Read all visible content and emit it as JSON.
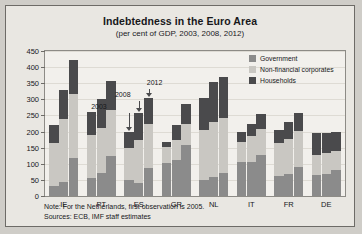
{
  "chart_data": {
    "type": "bar",
    "title": "Indebtedness in the Euro Area",
    "subtitle": "(per cent of GDP, 2003, 2008, 2012)",
    "xlabel": "",
    "ylabel": "",
    "ylim": [
      0,
      450
    ],
    "ytick_step": 50,
    "yticks": [
      "450",
      "400",
      "350",
      "300",
      "250",
      "200",
      "150",
      "100",
      "50",
      "0"
    ],
    "grid": true,
    "legend_position": "top-right",
    "stacked": true,
    "categories": [
      "IE",
      "PT",
      "ES",
      "GR",
      "NL",
      "IT",
      "FR",
      "DE"
    ],
    "years": [
      "2003",
      "2008",
      "2012"
    ],
    "series": [
      {
        "name": "Government",
        "color": "#8b8b8b",
        "values_by_year": {
          "2003": [
            31,
            57,
            49,
            101,
            50,
            105,
            63,
            64
          ],
          "2008": [
            44,
            72,
            40,
            113,
            59,
            106,
            68,
            67
          ],
          "2012": [
            118,
            124,
            88,
            157,
            71,
            127,
            90,
            82
          ]
        }
      },
      {
        "name": "Non-financial corporates",
        "color": "#c9c7c2",
        "values_by_year": {
          "2003": [
            135,
            132,
            100,
            50,
            155,
            64,
            100,
            63
          ],
          "2008": [
            194,
            140,
            135,
            62,
            170,
            80,
            109,
            66
          ],
          "2012": [
            200,
            142,
            137,
            66,
            170,
            82,
            113,
            59
          ]
        }
      },
      {
        "name": "Households",
        "color": "#4a4a4c",
        "values_by_year": {
          "2003": [
            54,
            73,
            51,
            18,
            100,
            29,
            42,
            69
          ],
          "2008": [
            92,
            90,
            82,
            45,
            125,
            39,
            52,
            62
          ],
          "2012": [
            104,
            90,
            78,
            62,
            128,
            44,
            56,
            58
          ]
        }
      },
      {
        "name": "Government-2",
        "color": "#8b8b8b",
        "hidden": true,
        "values_by_year": {
          "2003": [
            0,
            0,
            0,
            0,
            0,
            0,
            0,
            0
          ],
          "2008": [
            0,
            0,
            0,
            0,
            0,
            0,
            0,
            0
          ],
          "2012": [
            0,
            0,
            0,
            0,
            0,
            0,
            0,
            0
          ]
        }
      }
    ],
    "totals_by_year": {
      "2003": [
        220,
        262,
        200,
        169,
        305,
        198,
        205,
        196
      ],
      "2008": [
        330,
        302,
        257,
        220,
        354,
        225,
        229,
        195
      ],
      "2012": [
        422,
        356,
        303,
        285,
        369,
        253,
        259,
        199
      ]
    },
    "annotations": [
      {
        "label": "2003",
        "category": "ES",
        "year_index": 0
      },
      {
        "label": "2008",
        "category": "ES",
        "year_index": 1
      },
      {
        "label": "2012",
        "category": "ES",
        "year_index": 2
      }
    ],
    "legend": [
      {
        "label": "Government",
        "color": "#8b8b8b",
        "key": "gov"
      },
      {
        "label": "Non-financial corporates",
        "color": "#c9c7c2",
        "key": "nfc"
      },
      {
        "label": "Households",
        "color": "#4a4a4c",
        "key": "hh"
      }
    ],
    "notes": [
      "Note: For the Netherlands, first observation is 2005.",
      "Sources: ECB, IMF staff estimates"
    ]
  }
}
